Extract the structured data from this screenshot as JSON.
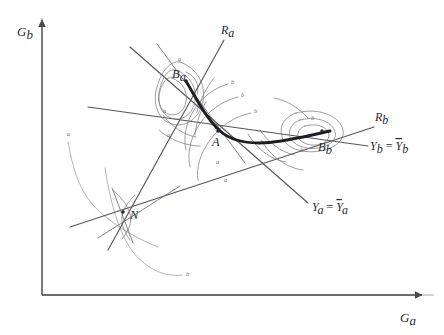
{
  "figure": {
    "type": "economics-diagram",
    "background_color": "#ffffff",
    "ink_color": "#2a2a30",
    "contract_curve_color": "#1d1d22",
    "indifference_curve_color": "#77777f"
  },
  "axes": {
    "y_label": "G",
    "y_sub": "b",
    "x_label": "G",
    "x_sub": "a",
    "origin": {
      "x": 42,
      "y": 295
    },
    "x_end": {
      "x": 424,
      "y": 295
    },
    "y_end": {
      "x": 42,
      "y": 18
    }
  },
  "points": [
    {
      "name": "A",
      "label": "A",
      "sub": "",
      "x": 218,
      "y": 131,
      "dot": true
    },
    {
      "name": "B_a",
      "label": "B",
      "sub": "a",
      "x": 186,
      "y": 80,
      "dot": true
    },
    {
      "name": "B_b",
      "label": "B",
      "sub": "b",
      "x": 322,
      "y": 130,
      "dot": true
    },
    {
      "name": "N",
      "label": "N",
      "sub": "",
      "x": 123,
      "y": 212,
      "dot": true
    }
  ],
  "rays": [
    {
      "name": "R_a",
      "label": "R",
      "sub": "a",
      "label_x": 228,
      "label_y": 33
    },
    {
      "name": "R_b",
      "label": "R",
      "sub": "b",
      "label_x": 378,
      "label_y": 121
    }
  ],
  "constraints": [
    {
      "name": "Y_b_bar",
      "lhs": "Y",
      "lhs_sub": "b",
      "eq": "=",
      "rhs": "Y",
      "rhs_sub": "b",
      "rhs_bar": true,
      "label_x": 372,
      "label_y": 150
    },
    {
      "name": "Y_a_bar",
      "lhs": "Y",
      "lhs_sub": "a",
      "eq": "=",
      "rhs": "Y",
      "rhs_sub": "a",
      "rhs_bar": true,
      "label_x": 314,
      "label_y": 210
    }
  ],
  "curve_tags": [
    {
      "id": "tag-a-1",
      "text": "a",
      "x": 178,
      "y": 61
    },
    {
      "id": "tag-a-2",
      "text": "a",
      "x": 163,
      "y": 113
    },
    {
      "id": "tag-a-3",
      "text": "a",
      "x": 167,
      "y": 137
    },
    {
      "id": "tag-a-4",
      "text": "a",
      "x": 67,
      "y": 136
    },
    {
      "id": "tag-a-5",
      "text": "a",
      "x": 216,
      "y": 164
    },
    {
      "id": "tag-a-6",
      "text": "a",
      "x": 224,
      "y": 182
    },
    {
      "id": "tag-b-1",
      "text": "b",
      "x": 231,
      "y": 84
    },
    {
      "id": "tag-b-2",
      "text": "b",
      "x": 241,
      "y": 97
    },
    {
      "id": "tag-b-3",
      "text": "b",
      "x": 254,
      "y": 113
    },
    {
      "id": "tag-b-4",
      "text": "b",
      "x": 311,
      "y": 120
    },
    {
      "id": "tag-b-5",
      "text": "b",
      "x": 300,
      "y": 152
    },
    {
      "id": "tag-b-6",
      "text": "b",
      "x": 186,
      "y": 276
    }
  ]
}
